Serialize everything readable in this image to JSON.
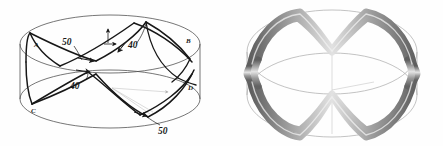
{
  "figure": {
    "panels": [
      {
        "id": "schematic",
        "name": "hand-drawn-winding-schematic",
        "description": "Hand drawn line schematic of a geodesic filament winding path on a cylindrical mandrel, shown as two ellipses (top and bottom rims) crossed by wound fiber bands with angle callouts."
      },
      {
        "id": "render",
        "name": "three-dimensional-winding-render",
        "description": "Shaded three dimensional CAD rendering of the same wound tube pattern on a cylinder, grey tubular bands over faint wireframe ellipses."
      }
    ],
    "annotations": {
      "angle_top_left": "50",
      "angle_top_right": "40",
      "angle_bottom_left": "40",
      "angle_bottom_right": "50",
      "vertex_left_upper": "A",
      "vertex_right_upper": "B",
      "vertex_left_lower": "C",
      "vertex_right_lower": "D"
    },
    "colors": {
      "ink": "#1a1a1a",
      "rim_line": "#555555",
      "faint_line": "#b9b9b9",
      "tube_light": "#e8e8e8",
      "tube_mid": "#9a9a9a",
      "tube_dark": "#5e5e5e",
      "background": "#fefefe"
    }
  }
}
